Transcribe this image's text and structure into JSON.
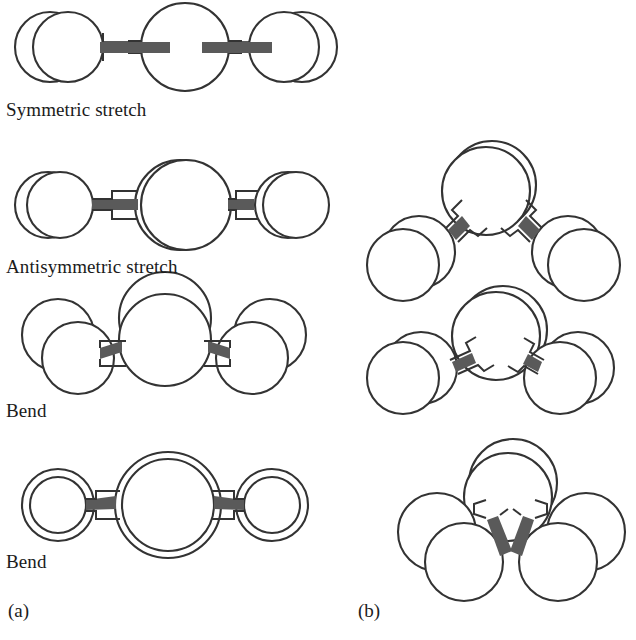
{
  "figure": {
    "title_absent": true,
    "background_color": "#ffffff",
    "atom_outline_color": "#333333",
    "bond_color": "#5a5a5a",
    "atom_fill": "#ffffff"
  },
  "panels": [
    {
      "id": "a",
      "label": "(a)",
      "label_x": 8,
      "label_y": 600,
      "molecule_type": "linear triatomic",
      "modes": [
        {
          "name": "symmetric-stretch",
          "label": "Symmetric stretch",
          "label_x": 6,
          "label_y": 99
        },
        {
          "name": "antisymmetric-stretch",
          "label": "Antisymmetric stretch",
          "label_x": 6,
          "label_y": 256
        },
        {
          "name": "bend-in-plane",
          "label": "Bend",
          "label_x": 6,
          "label_y": 400
        },
        {
          "name": "bend-out-of-plane",
          "label": "Bend",
          "label_x": 6,
          "label_y": 551
        }
      ]
    },
    {
      "id": "b",
      "label": "(b)",
      "label_x": 358,
      "label_y": 600,
      "molecule_type": "bent pyramidal",
      "modes": [
        {
          "name": "mode-b-1",
          "label": ""
        },
        {
          "name": "mode-b-2",
          "label": ""
        },
        {
          "name": "mode-b-3",
          "label": ""
        }
      ]
    }
  ]
}
